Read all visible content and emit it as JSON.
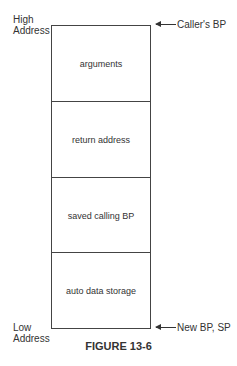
{
  "labels": {
    "high": [
      "High",
      "Address"
    ],
    "low": [
      "Low",
      "Address"
    ]
  },
  "stack": {
    "cells": [
      "arguments",
      "return address",
      "saved calling BP",
      "auto data storage"
    ]
  },
  "pointers": {
    "top": "Caller's BP",
    "bottom": "New BP, SP"
  },
  "caption": "FIGURE 13-6"
}
